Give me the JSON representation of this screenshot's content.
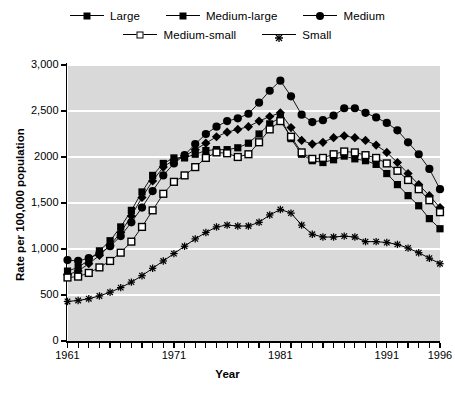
{
  "legend": {
    "rows": [
      [
        {
          "label": "Large",
          "marker": "filled-square"
        },
        {
          "label": "Medium-large",
          "marker": "filled-diamond"
        },
        {
          "label": "Medium",
          "marker": "filled-circle"
        }
      ],
      [
        {
          "label": "Medium-small",
          "marker": "open-square"
        },
        {
          "label": "Small",
          "marker": "star"
        }
      ]
    ]
  },
  "axes": {
    "y_title": "Rate per 100,000 population",
    "x_title": "Year",
    "y_ticklabels": [
      "0",
      "500",
      "1,000",
      "1,500",
      "2000",
      "2,500",
      "3,000"
    ],
    "x_ticklabels": [
      "1961",
      "1971",
      "1981",
      "1991",
      "1996"
    ]
  },
  "colors": {
    "plot_background": "#d9d9d9",
    "gridline": "#ffffff",
    "ink": "#000000",
    "page_background": "#ffffff"
  },
  "caption": "",
  "chart_data": {
    "type": "line",
    "title": "",
    "subtitle": "",
    "xlabel": "Year",
    "ylabel": "Rate per 100,000 population",
    "xlim": [
      1961,
      1996
    ],
    "ylim": [
      0,
      3000
    ],
    "yticks": [
      0,
      500,
      1000,
      1500,
      2000,
      2500,
      3000
    ],
    "ytick_labels": [
      "0",
      "500",
      "1,000",
      "1,500",
      "2000",
      "2,500",
      "3,000"
    ],
    "xticks": [
      1961,
      1971,
      1981,
      1991,
      1996
    ],
    "xtick_labels": [
      "1961",
      "1971",
      "1981",
      "1991",
      "1996"
    ],
    "grid": "horizontal",
    "legend_position": "above-plot",
    "x": [
      1961,
      1962,
      1963,
      1964,
      1965,
      1966,
      1967,
      1968,
      1969,
      1970,
      1971,
      1972,
      1973,
      1974,
      1975,
      1976,
      1977,
      1978,
      1979,
      1980,
      1981,
      1982,
      1983,
      1984,
      1985,
      1986,
      1987,
      1988,
      1989,
      1990,
      1991,
      1992,
      1993,
      1994,
      1995,
      1996
    ],
    "series": [
      {
        "name": "Large",
        "marker": "filled-square",
        "values": [
          760,
          800,
          880,
          980,
          1090,
          1240,
          1420,
          1620,
          1800,
          1930,
          1990,
          1990,
          2030,
          2070,
          2080,
          2080,
          2100,
          2150,
          2250,
          2360,
          2430,
          2200,
          2030,
          1960,
          1940,
          1970,
          2010,
          1980,
          1960,
          1920,
          1820,
          1700,
          1580,
          1470,
          1330,
          1220
        ]
      },
      {
        "name": "Medium-large",
        "marker": "filled-diamond",
        "values": [
          720,
          760,
          840,
          930,
          1040,
          1180,
          1360,
          1560,
          1740,
          1890,
          1970,
          2010,
          2080,
          2150,
          2220,
          2270,
          2300,
          2330,
          2390,
          2440,
          2480,
          2320,
          2180,
          2140,
          2160,
          2210,
          2230,
          2210,
          2180,
          2130,
          2050,
          1940,
          1820,
          1700,
          1580,
          1450
        ]
      },
      {
        "name": "Medium",
        "marker": "filled-circle",
        "values": [
          880,
          870,
          900,
          950,
          1030,
          1140,
          1290,
          1450,
          1630,
          1800,
          1930,
          2020,
          2140,
          2250,
          2330,
          2390,
          2420,
          2470,
          2590,
          2720,
          2830,
          2660,
          2460,
          2380,
          2400,
          2450,
          2530,
          2530,
          2480,
          2430,
          2370,
          2290,
          2160,
          2030,
          1870,
          1650
        ]
      },
      {
        "name": "Medium-small",
        "marker": "open-square",
        "values": [
          690,
          700,
          740,
          800,
          870,
          960,
          1080,
          1240,
          1420,
          1600,
          1730,
          1800,
          1890,
          1990,
          2050,
          2040,
          2000,
          2030,
          2160,
          2300,
          2390,
          2220,
          2050,
          1980,
          1990,
          2030,
          2060,
          2050,
          2020,
          1990,
          1930,
          1850,
          1750,
          1650,
          1530,
          1400
        ]
      },
      {
        "name": "Small",
        "marker": "star",
        "values": [
          430,
          440,
          460,
          490,
          530,
          580,
          640,
          710,
          790,
          870,
          950,
          1030,
          1110,
          1180,
          1240,
          1260,
          1250,
          1250,
          1290,
          1370,
          1430,
          1390,
          1260,
          1160,
          1130,
          1130,
          1140,
          1130,
          1080,
          1080,
          1070,
          1050,
          1010,
          960,
          900,
          840
        ]
      }
    ]
  }
}
